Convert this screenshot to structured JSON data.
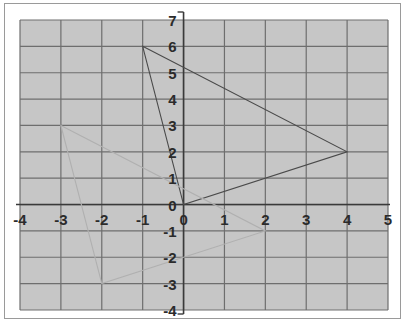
{
  "figure": {
    "background_color": "#ffffff",
    "grid_fill_color": "#c6c6c6",
    "grid_line_color": "#6e6e6e",
    "axis_line_color": "#3a3a3a",
    "border_color": "#9a9a9a",
    "shape_primary_color": "#4a4a4a",
    "shape_image_color": "#b0b0b0"
  },
  "chart_data": {
    "type": "scatter",
    "title": "",
    "subtitle": "",
    "xlabel": "",
    "ylabel": "",
    "xlim": [
      -4,
      5
    ],
    "ylim": [
      -4,
      7
    ],
    "grid": true,
    "grid_step": 1,
    "legend": "none",
    "x_tick_labels": [
      "-4",
      "-3",
      "-2",
      "-1",
      "0",
      "1",
      "2",
      "3",
      "4",
      "5"
    ],
    "x_tick_values": [
      -4,
      -3,
      -2,
      -1,
      0,
      1,
      2,
      3,
      4,
      5
    ],
    "y_tick_labels": [
      "7",
      "6",
      "5",
      "4",
      "3",
      "2",
      "1",
      "0",
      "-1",
      "-2",
      "-3",
      "-4"
    ],
    "y_tick_values": [
      7,
      6,
      5,
      4,
      3,
      2,
      1,
      0,
      -1,
      -2,
      -3,
      -4
    ],
    "series": [
      {
        "name": "triangle-preimage",
        "type": "polygon",
        "stroke": "#4a4a4a",
        "stroke_width": 1.1,
        "closed": true,
        "points": [
          [
            -1,
            6
          ],
          [
            4,
            2
          ],
          [
            0,
            0
          ]
        ]
      },
      {
        "name": "triangle-image",
        "type": "polygon",
        "stroke": "#b0b0b0",
        "stroke_width": 1.1,
        "closed": true,
        "points": [
          [
            -3,
            3
          ],
          [
            2,
            -1
          ],
          [
            -2,
            -3
          ]
        ]
      }
    ],
    "annotations": []
  },
  "axes": {
    "x_axis_name": "x-axis",
    "y_axis_name": "y-axis",
    "origin_label": "0"
  }
}
